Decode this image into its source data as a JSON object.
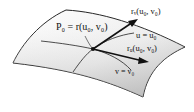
{
  "figure": {
    "type": "parametric-surface-tangent-vectors",
    "labels": {
      "point": "P₀ = r(u₀, v₀)",
      "r_v": "rᵥ(u₀, v₀)",
      "u_curve": "u = u₀",
      "r_u": "rᵤ(u₀, v₀)",
      "v_curve": "v = v₀"
    },
    "colors": {
      "surface_light": "#f4f4f4",
      "surface_dark": "#c8c8c8",
      "outline": "#222222",
      "vector": "#111111"
    }
  }
}
